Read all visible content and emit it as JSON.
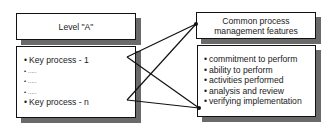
{
  "left": {
    "title": "Level \"A\"",
    "items": [
      "Key process - 1",
      ".....",
      ".....",
      ".....",
      "Key process - n"
    ]
  },
  "right": {
    "title_line1": "Common process",
    "title_line2": "management features",
    "items": [
      "commitment to perform",
      "ability to perform",
      "activities performed",
      "analysis and review",
      "verifying implementation"
    ]
  },
  "colors": {
    "border": "#111111",
    "shadow": "#6a6a6a",
    "background": "#ffffff"
  }
}
